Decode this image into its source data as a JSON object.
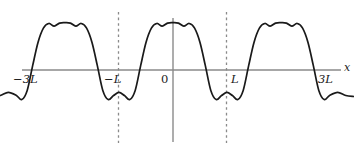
{
  "figure": {
    "title": "",
    "axis_label_x": "x",
    "axis_label_y": ""
  },
  "labels": {
    "neg_three_l": "−3L",
    "neg_l": "−L",
    "zero": "0",
    "pos_l": "L",
    "pos_three_l": "3L",
    "x_axis": "x"
  },
  "colors": {
    "curve": "#1a1a1a",
    "axis": "#8a8a8a",
    "dashed": "#8a8a8a",
    "background": "#ffffff",
    "text": "#1a1a1a"
  },
  "chart_data": {
    "type": "line",
    "title": "",
    "xlabel": "x",
    "ylabel": "",
    "grid": false,
    "legend": null,
    "xlim": [
      -3.35,
      3.35
    ],
    "ylim": [
      -1.55,
      2.6
    ],
    "x_ticks": [
      -3,
      -1,
      0,
      1,
      3
    ],
    "x_tick_labels": [
      "−3L",
      "−L",
      "0",
      "L",
      "3L"
    ],
    "y_ticks": [],
    "y_tick_labels": [],
    "annotations": [
      {
        "type": "vline",
        "x": -1,
        "style": "dashed",
        "label": "−L"
      },
      {
        "type": "vline",
        "x": 0,
        "style": "solid",
        "label": "0"
      },
      {
        "type": "vline",
        "x": 1,
        "style": "dashed",
        "label": "L"
      },
      {
        "type": "hline",
        "y": 0,
        "style": "solid",
        "label": "x-axis"
      }
    ],
    "period": 2,
    "series": [
      {
        "name": "psi",
        "x": [
          -3.35,
          -3.2,
          -3.05,
          -2.9,
          -2.8,
          -2.7,
          -2.6,
          -2.5,
          -2.4,
          -2.3,
          -2.2,
          -2.1,
          -2.0,
          -1.9,
          -1.8,
          -1.7,
          -1.6,
          -1.5,
          -1.4,
          -1.3,
          -1.2,
          -1.1,
          -1.0,
          -0.9,
          -0.8,
          -0.7,
          -0.6,
          -0.5,
          -0.4,
          -0.3,
          -0.2,
          -0.1,
          0.0,
          0.1,
          0.2,
          0.3,
          0.4,
          0.5,
          0.6,
          0.7,
          0.8,
          0.9,
          1.0,
          1.1,
          1.2,
          1.3,
          1.4,
          1.5,
          1.6,
          1.7,
          1.8,
          1.9,
          2.0,
          2.1,
          2.2,
          2.3,
          2.4,
          2.5,
          2.6,
          2.7,
          2.8,
          2.9,
          3.05,
          3.2,
          3.35
        ],
        "y": [
          -1.3,
          -1.25,
          -1.1,
          -1.25,
          -1.45,
          -1.0,
          0.2,
          1.35,
          2.05,
          2.28,
          2.15,
          2.3,
          2.32,
          2.3,
          2.15,
          2.28,
          2.05,
          1.35,
          0.2,
          -1.0,
          -1.45,
          -1.25,
          -1.1,
          -1.25,
          -1.45,
          -1.0,
          0.2,
          1.35,
          2.05,
          2.28,
          2.15,
          2.3,
          2.32,
          2.3,
          2.15,
          2.28,
          2.05,
          1.35,
          0.2,
          -1.0,
          -1.45,
          -1.25,
          -1.1,
          -1.25,
          -1.45,
          -1.0,
          0.2,
          1.35,
          2.05,
          2.28,
          2.15,
          2.3,
          2.32,
          2.3,
          2.15,
          2.28,
          2.05,
          1.35,
          0.2,
          -1.0,
          -1.45,
          -1.25,
          -1.1,
          -1.25,
          -1.3
        ]
      }
    ]
  },
  "geometry": {
    "axis_y_px": 70,
    "axis_x0_px": 173,
    "unit_l_px": 54,
    "axis_left_px": 22,
    "axis_right_px": 341
  }
}
